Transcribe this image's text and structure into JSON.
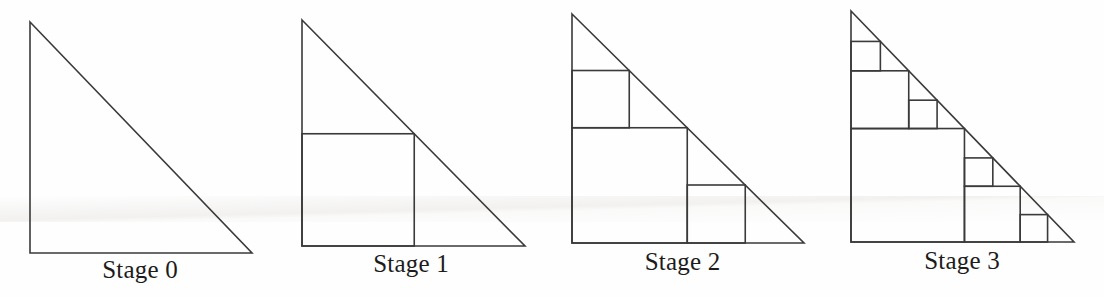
{
  "figure": {
    "background_color": "#fefefe",
    "stroke_color": "#3a3a3a",
    "stroke_width": 1.6,
    "canvas": {
      "width": 1104,
      "height": 297
    }
  },
  "stages": [
    {
      "id": "stage-0",
      "label": "Stage 0",
      "depth": 0,
      "square_count": 0,
      "panel": {
        "left": 0,
        "width": 280
      },
      "triangle": {
        "apex_x": 30,
        "apex_y": 22,
        "base_y": 253,
        "right_x": 252
      },
      "label_y": 256
    },
    {
      "id": "stage-1",
      "label": "Stage 1",
      "depth": 1,
      "square_count": 1,
      "panel": {
        "left": 280,
        "width": 262
      },
      "triangle": {
        "apex_x": 22,
        "apex_y": 20,
        "base_y": 246,
        "right_x": 245
      },
      "label_y": 250
    },
    {
      "id": "stage-2",
      "label": "Stage 2",
      "depth": 2,
      "square_count": 3,
      "panel": {
        "left": 545,
        "width": 275
      },
      "triangle": {
        "apex_x": 27,
        "apex_y": 14,
        "base_y": 243,
        "right_x": 259
      },
      "label_y": 248
    },
    {
      "id": "stage-3",
      "label": "Stage 3",
      "depth": 3,
      "square_count": 7,
      "panel": {
        "left": 820,
        "width": 284
      },
      "triangle": {
        "apex_x": 31,
        "apex_y": 11,
        "base_y": 242,
        "right_x": 254
      },
      "label_y": 247
    }
  ],
  "labels": {
    "font_size": 25,
    "color": "#1c1c1c"
  }
}
